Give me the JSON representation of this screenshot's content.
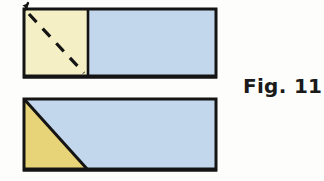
{
  "figure": {
    "caption": "Fig. 11",
    "caption_position": "right-middle",
    "background_color": "#fdfdfb"
  },
  "palette": {
    "pale_yellow": "#f4efc4",
    "gold_yellow": "#e8d478",
    "light_blue": "#c3d7ec",
    "outline_black": "#141414",
    "caption_color": "#1a1a1a"
  },
  "diagram_data": {
    "type": "diagram",
    "title": "Fig. 11",
    "description": "Two horizontal rectangles illustrating a square folded along its diagonal",
    "shapes": [
      {
        "id": "top-rectangle",
        "name": "upper-rectangle",
        "role": "unfolded-state",
        "x": 24,
        "y": 9,
        "width": 192,
        "height": 68,
        "stroke": "#141414",
        "stroke_width": 3,
        "regions": [
          {
            "id": "top-yellow-square",
            "name": "yellow-square-region",
            "fill": "#f4efc4",
            "x": 24,
            "y": 9,
            "width": 64,
            "height": 68
          },
          {
            "id": "top-blue-region",
            "name": "blue-rectangle-region",
            "fill": "#c3d7ec",
            "x": 88,
            "y": 9,
            "width": 128,
            "height": 68
          }
        ],
        "divider": {
          "id": "vertical-divider",
          "name": "vertical-divider-line",
          "style": "solid",
          "x1": 88,
          "y1": 9,
          "x2": 88,
          "y2": 77
        },
        "fold_line": {
          "id": "dashed-diagonal",
          "name": "dashed-fold-diagonal",
          "style": "dashed",
          "dash_count": 3,
          "x1": 24,
          "y1": 9,
          "x2": 88,
          "y2": 77
        },
        "marker": {
          "id": "corner-tick",
          "name": "corner-arrow-tick",
          "x": 25,
          "y": 3
        }
      },
      {
        "id": "bottom-rectangle",
        "name": "lower-rectangle",
        "role": "folded-state",
        "x": 24,
        "y": 99,
        "width": 192,
        "height": 71,
        "stroke": "#141414",
        "stroke_width": 3,
        "regions": [
          {
            "id": "bottom-gold-triangle",
            "name": "gold-triangle-region",
            "fill": "#e8d478",
            "points": "24,99 88,170 24,170"
          },
          {
            "id": "bottom-blue-region",
            "name": "blue-trapezoid-region",
            "fill": "#c3d7ec",
            "points": "24,99 216,99 216,170 88,170"
          }
        ],
        "fold_line": {
          "id": "solid-diagonal",
          "name": "solid-fold-diagonal",
          "style": "solid",
          "x1": 24,
          "y1": 99,
          "x2": 88,
          "y2": 170
        }
      }
    ]
  }
}
